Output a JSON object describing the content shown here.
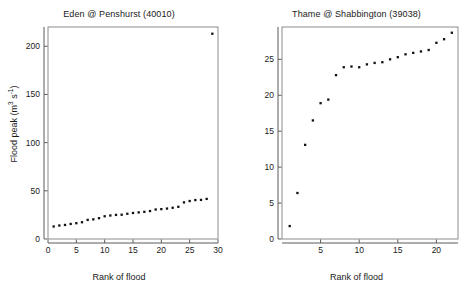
{
  "figure": {
    "background": "#ffffff",
    "marker_color": "#111111",
    "frame_color": "#8c8c8c"
  },
  "axis_labels": {
    "x": "Rank of flood",
    "y_prefix": "Flood peak (m",
    "y_sup1": "3",
    "y_mid": " s",
    "y_sup2": "-1",
    "y_suffix": ")"
  },
  "chart_data": [
    {
      "type": "scatter",
      "title": "Eden @ Penshurst (40010)",
      "xlabel": "Rank of flood",
      "ylabel": "Flood peak (m3 s-1)",
      "xlim": [
        0,
        30
      ],
      "ylim": [
        0,
        220
      ],
      "xticks": [
        0,
        5,
        10,
        15,
        20,
        25,
        30
      ],
      "yticks": [
        0,
        50,
        100,
        150,
        200
      ],
      "grid": false,
      "legend": "none",
      "x": [
        1,
        2,
        3,
        4,
        5,
        6,
        7,
        8,
        9,
        10,
        11,
        12,
        13,
        14,
        15,
        16,
        17,
        18,
        19,
        20,
        21,
        22,
        23,
        24,
        25,
        26,
        27,
        28,
        29
      ],
      "y": [
        13.0,
        14.0,
        14.6,
        15.6,
        16.4,
        17.4,
        19.8,
        20.4,
        21.6,
        23.6,
        24.4,
        25.0,
        25.2,
        26.2,
        27.0,
        27.6,
        28.2,
        29.0,
        30.6,
        31.0,
        31.6,
        32.4,
        33.4,
        38.0,
        39.4,
        40.4,
        40.6,
        41.6,
        213.0
      ]
    },
    {
      "type": "scatter",
      "title": "Thame @ Shabbington (39038)",
      "xlabel": "Rank of flood",
      "ylabel": "Flood peak (m3 s-1)",
      "xlim": [
        0,
        22.8
      ],
      "ylim": [
        0,
        29.5
      ],
      "xticks": [
        5,
        10,
        15,
        20
      ],
      "yticks": [
        0,
        5,
        10,
        15,
        20,
        25
      ],
      "grid": false,
      "legend": "none",
      "x": [
        1,
        2,
        3,
        4,
        5,
        6,
        7,
        8,
        9,
        10,
        11,
        12,
        13,
        14,
        15,
        16,
        17,
        18,
        19,
        20,
        21,
        22
      ],
      "y": [
        1.8,
        6.4,
        13.1,
        16.5,
        18.9,
        19.4,
        22.8,
        23.9,
        24.0,
        23.9,
        24.3,
        24.5,
        24.6,
        25.0,
        25.3,
        25.7,
        25.9,
        26.1,
        26.3,
        27.3,
        27.8,
        28.7
      ]
    }
  ]
}
